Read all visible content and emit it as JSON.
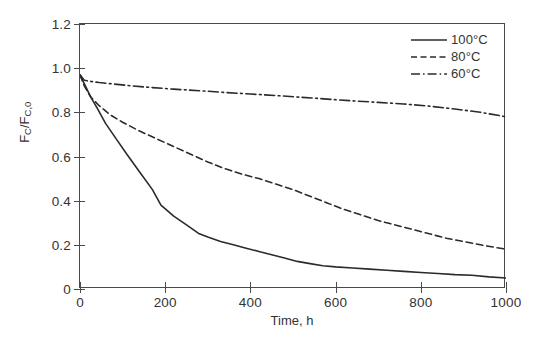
{
  "chart_data": {
    "type": "line",
    "title": "",
    "subtitle": "",
    "xlabel": "Time, h",
    "ylabel": "FC/FC,0",
    "ylabel_parts": {
      "num_main": "F",
      "num_sub": "C",
      "slash": "/",
      "den_main": "F",
      "den_sub": "C,0"
    },
    "xlim": [
      0,
      1000
    ],
    "ylim": [
      0,
      1.2
    ],
    "xticks": [
      0,
      200,
      400,
      600,
      800,
      1000
    ],
    "xtick_labels": [
      "0",
      "200",
      "400",
      "600",
      "800",
      "1000"
    ],
    "yticks": [
      0,
      0.2,
      0.4,
      0.6,
      0.8,
      1.0,
      1.2
    ],
    "ytick_labels": [
      "0",
      "0.2",
      "0.4",
      "0.6",
      "0.8",
      "1.0",
      "1.2"
    ],
    "grid": false,
    "frame": "box",
    "legend_position": "top-right-inside",
    "line_color": "#2b2b2b",
    "background_color": "#ffffff",
    "series": [
      {
        "name": "100°C",
        "style": "solid",
        "x": [
          0,
          10,
          25,
          40,
          60,
          85,
          110,
          140,
          170,
          190,
          220,
          250,
          280,
          300,
          330,
          360,
          390,
          420,
          450,
          480,
          510,
          540,
          570,
          600,
          640,
          680,
          720,
          760,
          800,
          840,
          880,
          920,
          960,
          1000
        ],
        "y": [
          0.97,
          0.93,
          0.87,
          0.82,
          0.75,
          0.68,
          0.61,
          0.53,
          0.45,
          0.38,
          0.33,
          0.29,
          0.25,
          0.235,
          0.215,
          0.2,
          0.185,
          0.17,
          0.155,
          0.14,
          0.125,
          0.115,
          0.105,
          0.1,
          0.095,
          0.09,
          0.085,
          0.08,
          0.075,
          0.07,
          0.065,
          0.062,
          0.055,
          0.05
        ]
      },
      {
        "name": "80°C",
        "style": "dashed",
        "x": [
          0,
          10,
          25,
          45,
          70,
          100,
          140,
          180,
          220,
          260,
          300,
          340,
          380,
          420,
          460,
          500,
          540,
          580,
          620,
          660,
          700,
          740,
          780,
          820,
          860,
          900,
          940,
          1000
        ],
        "y": [
          0.97,
          0.92,
          0.87,
          0.83,
          0.79,
          0.755,
          0.715,
          0.68,
          0.645,
          0.61,
          0.575,
          0.545,
          0.52,
          0.5,
          0.475,
          0.45,
          0.42,
          0.39,
          0.36,
          0.335,
          0.31,
          0.29,
          0.27,
          0.25,
          0.23,
          0.215,
          0.2,
          0.18
        ]
      },
      {
        "name": "60°C",
        "style": "dash-dot",
        "x": [
          0,
          10,
          25,
          45,
          80,
          120,
          170,
          220,
          280,
          340,
          400,
          460,
          520,
          580,
          640,
          700,
          760,
          820,
          880,
          940,
          1000
        ],
        "y": [
          0.97,
          0.945,
          0.94,
          0.935,
          0.928,
          0.92,
          0.912,
          0.905,
          0.898,
          0.89,
          0.883,
          0.876,
          0.868,
          0.86,
          0.852,
          0.845,
          0.838,
          0.828,
          0.815,
          0.8,
          0.78
        ]
      }
    ],
    "legend": [
      {
        "label": "100°C",
        "style": "solid"
      },
      {
        "label": "80°C",
        "style": "dashed"
      },
      {
        "label": "60°C",
        "style": "dash-dot"
      }
    ]
  }
}
